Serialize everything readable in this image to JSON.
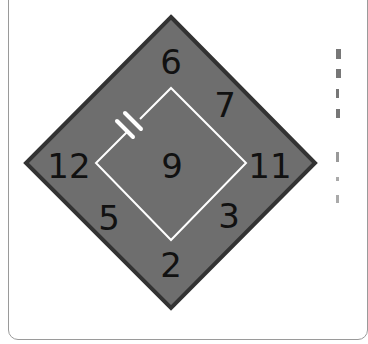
{
  "puzzle": {
    "diamond_color": "#6e6e6e",
    "border_color": "#333333",
    "wire_color": "#ffffff",
    "numbers": {
      "top": "6",
      "upper_right": "7",
      "left": "12",
      "center": "9",
      "right": "11",
      "lower_left": "5",
      "lower_right": "3",
      "bottom": "2"
    },
    "component": "capacitor"
  }
}
